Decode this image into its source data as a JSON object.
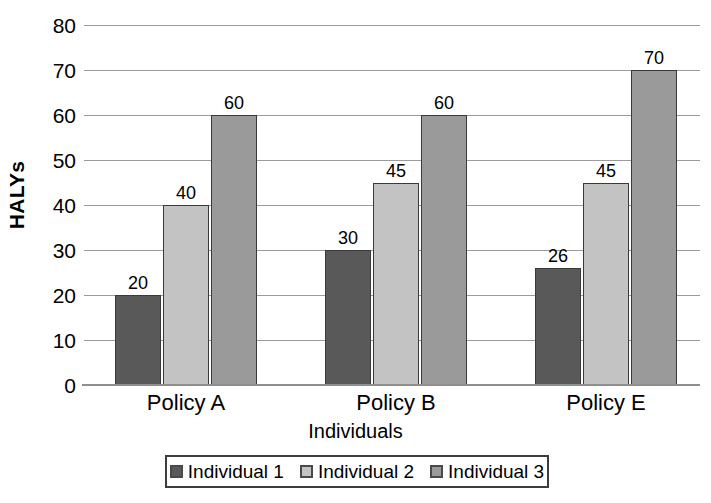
{
  "chart_data": {
    "type": "bar",
    "title": "",
    "subtitle": "",
    "xlabel": "Individuals",
    "ylabel": "HALYs",
    "categories": [
      "Policy A",
      "Policy B",
      "Policy E"
    ],
    "series": [
      {
        "name": "Individual 1",
        "values": [
          20,
          30,
          26
        ],
        "color": "#595959"
      },
      {
        "name": "Individual 2",
        "values": [
          40,
          45,
          45
        ],
        "color": "#c3c3c3"
      },
      {
        "name": "Individual 3",
        "values": [
          60,
          60,
          70
        ],
        "color": "#9a9a9a"
      }
    ],
    "ylim": [
      0,
      80
    ],
    "y_ticks": [
      0,
      10,
      20,
      30,
      40,
      50,
      60,
      70,
      80
    ],
    "y_tick_labels": [
      "0",
      "10",
      "20",
      "30",
      "40",
      "50",
      "60",
      "70",
      "80"
    ],
    "grid": true,
    "grid_axis": "y",
    "data_labels": true,
    "data_label_values": [
      [
        "20",
        "40",
        "60"
      ],
      [
        "30",
        "45",
        "60"
      ],
      [
        "26",
        "45",
        "70"
      ]
    ],
    "legend_position": "bottom",
    "legend_entries": [
      "Individual 1",
      "Individual 2",
      "Individual 3"
    ],
    "bar_border_color": "#3a3a3a",
    "gridline_color": "#9b9b9b",
    "background_color": "#ffffff"
  }
}
